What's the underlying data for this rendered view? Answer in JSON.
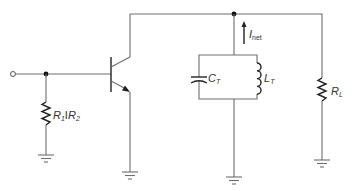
{
  "diagram": {
    "type": "circuit-schematic",
    "title": "",
    "components": [
      {
        "id": "input-terminal",
        "kind": "terminal"
      },
      {
        "id": "q1",
        "kind": "npn-transistor"
      },
      {
        "id": "r1r2",
        "kind": "resistor",
        "label_main": "R",
        "label_sub1": "1",
        "label_sep": "I",
        "label_main2": "R",
        "label_sub2": "2"
      },
      {
        "id": "ct",
        "kind": "capacitor",
        "label_main": "C",
        "label_sub": "T"
      },
      {
        "id": "lt",
        "kind": "inductor",
        "label_main": "L",
        "label_sub": "T"
      },
      {
        "id": "rl",
        "kind": "resistor",
        "label_main": "R",
        "label_sub": "L"
      },
      {
        "id": "inet",
        "kind": "current-arrow",
        "label_main": "I",
        "label_sub": "net"
      }
    ],
    "grounds": 4
  },
  "labels": {
    "r1r2": {
      "main": "R",
      "sub1": "1",
      "sep": "I",
      "main2": "R",
      "sub2": "2"
    },
    "ct": {
      "main": "C",
      "sub": "T"
    },
    "lt": {
      "main": "L",
      "sub": "T"
    },
    "rl": {
      "main": "R",
      "sub": "L"
    },
    "inet": {
      "main": "I",
      "sub": "net"
    }
  },
  "colors": {
    "wire": "#6e6e6e",
    "component": "#222222",
    "background": "#ffffff"
  }
}
